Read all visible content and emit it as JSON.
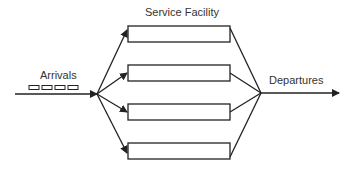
{
  "diagram": {
    "title": "Service Facility",
    "input_label": "Arrivals",
    "output_label": "Departures",
    "servers": [
      {
        "id": "server-1"
      },
      {
        "id": "server-2"
      },
      {
        "id": "server-3"
      },
      {
        "id": "server-4"
      }
    ],
    "queue_items": 4,
    "colors": {
      "stroke": "#222222",
      "text": "#333333",
      "background": "#ffffff"
    }
  }
}
